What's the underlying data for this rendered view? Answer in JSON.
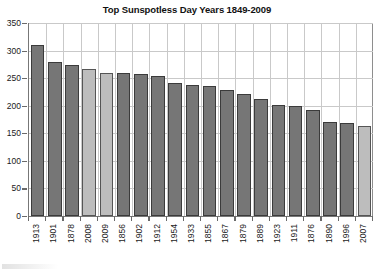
{
  "chart_data": {
    "type": "bar",
    "title": "Top Sunspotless Day Years 1849-2009",
    "xlabel": "",
    "ylabel": "",
    "ylim": [
      0,
      350
    ],
    "yticks": [
      0,
      50,
      100,
      150,
      200,
      250,
      300,
      350
    ],
    "grid": true,
    "legend": null,
    "categories": [
      "1913",
      "1901",
      "1878",
      "2008",
      "2009",
      "1856",
      "1902",
      "1912",
      "1954",
      "1933",
      "1855",
      "1867",
      "1879",
      "1889",
      "1923",
      "1911",
      "1876",
      "1890",
      "1996",
      "2007"
    ],
    "values": [
      311,
      280,
      274,
      266,
      260,
      259,
      258,
      254,
      241,
      238,
      235,
      228,
      222,
      213,
      202,
      199,
      192,
      170,
      169,
      163
    ],
    "bar_styles": [
      "dark",
      "dark",
      "dark",
      "light",
      "light",
      "dark",
      "dark",
      "dark",
      "dark",
      "dark",
      "dark",
      "dark",
      "dark",
      "dark",
      "dark",
      "dark",
      "dark",
      "dark",
      "dark",
      "light"
    ],
    "colors": {
      "bar_dark": "#767676",
      "bar_light": "#bdbdbd",
      "bar_border": "#3b3b3b",
      "grid": "#c9c9c9",
      "axis": "#777777",
      "text": "#1a1a1a",
      "background": "#ffffff"
    }
  }
}
